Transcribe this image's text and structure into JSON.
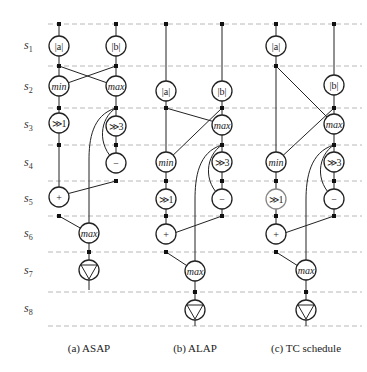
{
  "stages": [
    "s1",
    "s2",
    "s3",
    "s4",
    "s5",
    "s6",
    "s7",
    "s8"
  ],
  "stage_subs": [
    "1",
    "2",
    "3",
    "4",
    "5",
    "6",
    "7",
    "8"
  ],
  "node_labels": {
    "abs_a": "|a|",
    "abs_b": "|b|",
    "min": "min",
    "max": "max",
    "shr1": "≫1",
    "shr3": "≫3",
    "sub": "−",
    "add": "+"
  },
  "panels": [
    {
      "id": "asap",
      "caption": "(a)  ASAP"
    },
    {
      "id": "alap",
      "caption": "(b)  ALAP"
    },
    {
      "id": "tc",
      "caption": "(c)  TC schedule"
    }
  ],
  "colors": {
    "stroke": "#222222",
    "dashed": "#b8b8b8",
    "background": "#ffffff"
  }
}
